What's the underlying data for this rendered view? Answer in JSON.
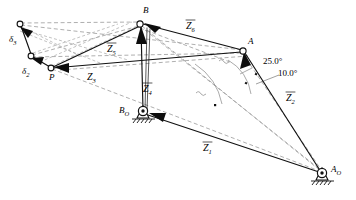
{
  "figure": {
    "type": "kinematic-linkage-diagram",
    "background_color": "#ffffff",
    "solid_color": "#111111",
    "dashed_color": "#9a9a9a"
  },
  "nodes": [
    {
      "id": "delta3",
      "label": "δ",
      "sub": "3",
      "x": 20,
      "y": 24,
      "kind": "pin"
    },
    {
      "id": "delta2",
      "label": "δ",
      "sub": "2",
      "x": 31,
      "y": 56,
      "kind": "pin"
    },
    {
      "id": "P",
      "label": "P",
      "sub": "",
      "x": 51,
      "y": 68,
      "kind": "pin"
    },
    {
      "id": "B",
      "label": "B",
      "sub": "",
      "x": 140,
      "y": 24,
      "kind": "pin"
    },
    {
      "id": "A",
      "label": "A",
      "sub": "",
      "x": 243,
      "y": 51,
      "kind": "pin"
    },
    {
      "id": "B0",
      "label": "B",
      "sub": "O",
      "x": 143,
      "y": 111,
      "kind": "ground-pivot"
    },
    {
      "id": "A0",
      "label": "A",
      "sub": "O",
      "x": 322,
      "y": 173,
      "kind": "ground-pivot"
    }
  ],
  "vectors": [
    {
      "id": "Z1",
      "label": "Z",
      "sub": "1",
      "overbar": true,
      "lx": 208,
      "ly": 150
    },
    {
      "id": "Z2",
      "label": "Z",
      "sub": "2",
      "overbar": true,
      "lx": 291,
      "ly": 101
    },
    {
      "id": "Z3",
      "label": "Z",
      "sub": "3",
      "overbar": false,
      "lx": 92,
      "ly": 79
    },
    {
      "id": "Z4",
      "label": "Z",
      "sub": "4",
      "overbar": true,
      "lx": 148,
      "ly": 92
    },
    {
      "id": "Z5",
      "label": "Z",
      "sub": "5",
      "overbar": true,
      "lx": 112,
      "ly": 52
    },
    {
      "id": "Z6",
      "label": "Z",
      "sub": "6",
      "overbar": true,
      "lx": 191,
      "ly": 29
    }
  ],
  "angles": [
    {
      "id": "ang-25",
      "value": "25.0°",
      "lx": 268,
      "ly": 62
    },
    {
      "id": "ang-10",
      "value": "10.0°",
      "lx": 283,
      "ly": 74
    }
  ],
  "links": {
    "solid": [
      {
        "name": "link-A0-A",
        "from": "A0",
        "to": "A"
      },
      {
        "name": "link-A0-B0",
        "from": "A0",
        "to": "B0"
      },
      {
        "name": "link-B0-B",
        "from": "B0",
        "to": "B"
      },
      {
        "name": "link-B-A",
        "from": "B",
        "to": "A"
      },
      {
        "name": "link-P-B",
        "from": "P",
        "to": "B"
      },
      {
        "name": "link-P-A",
        "from": "P",
        "to": "A"
      },
      {
        "name": "link-P-d2",
        "from": "P",
        "to": "delta2"
      },
      {
        "name": "link-d2-d3",
        "from": "delta2",
        "to": "delta3"
      }
    ],
    "dashed_note": "secondary displaced-position construction lines"
  }
}
